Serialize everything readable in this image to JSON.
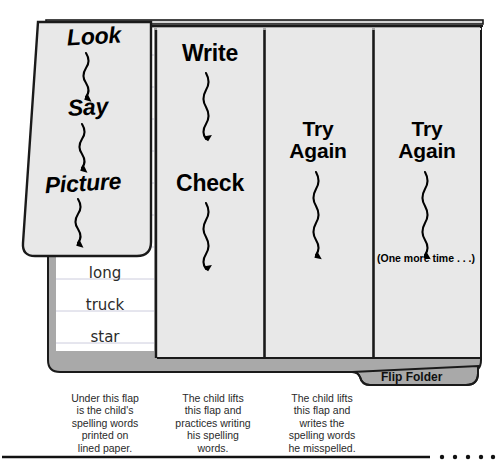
{
  "figure": {
    "title": "Flip Folder",
    "tab_label": "Flip Folder",
    "colors": {
      "panel_fill": "#e8e8e8",
      "folder_gray": "#a9a9a9",
      "paper_white": "#ffffff",
      "rule_line": "#c8c8d8",
      "ink": "#000000",
      "outline": "#1a1a1a"
    }
  },
  "flaps": [
    {
      "id": "flap-1",
      "steps": [
        "Look",
        "Say",
        "Picture"
      ],
      "style": "italic",
      "arrows": 3,
      "caption": "Under this flap\nis the child's\nspelling words\nprinted on\nlined paper."
    },
    {
      "id": "flap-2",
      "steps": [
        "Write",
        "Check"
      ],
      "style": "plain",
      "arrows": 2,
      "caption": "The child lifts\nthis flap and\npractices writing\nhis spelling\nwords."
    },
    {
      "id": "flap-3",
      "steps": [
        "Try\nAgain"
      ],
      "style": "two-line",
      "arrows": 1,
      "caption": "The child lifts\nthis flap and\nwrites the\nspelling words\nhe misspelled."
    },
    {
      "id": "flap-4",
      "steps": [
        "Try\nAgain"
      ],
      "style": "two-line",
      "arrows": 1,
      "note": "(One more time . . .)",
      "caption": ""
    }
  ],
  "lined_paper": {
    "words": [
      "long",
      "truck",
      "star"
    ],
    "rule_count": 9
  },
  "footer": {
    "has_rule": true,
    "dot_count": 5
  }
}
